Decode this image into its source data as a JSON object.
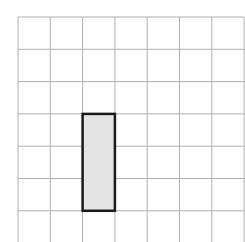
{
  "diagram": {
    "type": "grid",
    "columns": 7,
    "rows_visible": 7,
    "grid_origin": {
      "x": 18,
      "y": 17
    },
    "cell_size": 32.3,
    "grid_line_color": "#b0b0b0",
    "highlight": {
      "column_start": 3,
      "column_span": 1,
      "row_start": 4,
      "row_span": 3,
      "fill_color": "#e4e4e4",
      "border_color": "#1a1a1a"
    }
  }
}
